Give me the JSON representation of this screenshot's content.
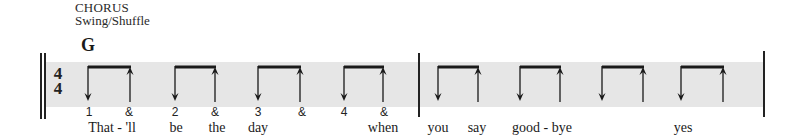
{
  "header": {
    "section": "CHORUS",
    "style": "Swing/Shuffle"
  },
  "chord": "G",
  "time_signature": {
    "top": "4",
    "bottom": "4"
  },
  "colors": {
    "band": "#e6e6e6",
    "ink": "#1a1a1a"
  },
  "measures": [
    {
      "counts": [
        "1",
        "&",
        "2",
        "&",
        "3",
        "&",
        "4",
        "&"
      ],
      "strums": [
        {
          "down_x": 88,
          "up_x": 130
        },
        {
          "down_x": 175,
          "up_x": 215
        },
        {
          "down_x": 258,
          "up_x": 300
        },
        {
          "down_x": 344,
          "up_x": 383
        }
      ]
    },
    {
      "counts": [],
      "strums": [
        {
          "down_x": 438,
          "up_x": 478
        },
        {
          "down_x": 520,
          "up_x": 560
        },
        {
          "down_x": 602,
          "up_x": 643
        },
        {
          "down_x": 681,
          "up_x": 723
        }
      ]
    }
  ],
  "counts": [
    {
      "label": "1",
      "x": 89
    },
    {
      "label": "&",
      "x": 129
    },
    {
      "label": "2",
      "x": 175
    },
    {
      "label": "&",
      "x": 215
    },
    {
      "label": "3",
      "x": 258
    },
    {
      "label": "&",
      "x": 302
    },
    {
      "label": "4",
      "x": 344
    },
    {
      "label": "&",
      "x": 384
    }
  ],
  "lyrics": [
    {
      "text": "That - 'll",
      "x": 112
    },
    {
      "text": "be",
      "x": 176
    },
    {
      "text": "the",
      "x": 217
    },
    {
      "text": "day",
      "x": 258
    },
    {
      "text": "when",
      "x": 383
    },
    {
      "text": "you",
      "x": 438
    },
    {
      "text": "say",
      "x": 477
    },
    {
      "text": "good - bye",
      "x": 542
    },
    {
      "text": "yes",
      "x": 683
    }
  ]
}
